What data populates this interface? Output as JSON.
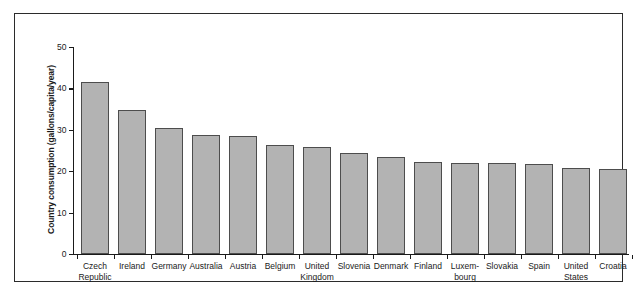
{
  "chart_data": {
    "type": "bar",
    "title": "",
    "xlabel": "",
    "ylabel": "Country consumption (gallons/capita/year)",
    "ylim": [
      0,
      50
    ],
    "yticks": [
      0,
      10,
      20,
      30,
      40,
      50
    ],
    "grid": false,
    "legend": null,
    "categories": [
      "Czech\nRepublic",
      "Ireland",
      "Germany",
      "Australia",
      "Austria",
      "Belgium",
      "United\nKingdom",
      "Slovenia",
      "Denmark",
      "Finland",
      "Luxem-\nbourg",
      "Slovakia",
      "Spain",
      "United\nStates",
      "Croatia"
    ],
    "values": [
      41.5,
      34.7,
      30.4,
      28.8,
      28.4,
      26.4,
      25.9,
      24.4,
      23.5,
      22.3,
      22.1,
      22.0,
      21.8,
      20.8,
      20.6
    ],
    "bar_color": "#b3b3b3",
    "bar_edge_color": "#4d4d4d",
    "axis_color": "#1a1a1a",
    "frame_color": "#2b2b2b",
    "background": "#ffffff"
  }
}
